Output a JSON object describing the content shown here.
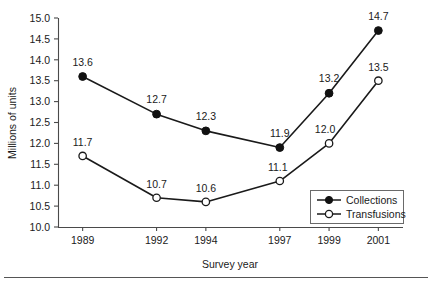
{
  "chart_data": {
    "type": "line",
    "title": "",
    "xlabel": "Survey year",
    "ylabel": "Millions of units",
    "categories": [
      "1989",
      "1992",
      "1994",
      "1997",
      "1999",
      "2001"
    ],
    "x": [
      1989,
      1992,
      1994,
      1997,
      1999,
      2001
    ],
    "xlim": [
      1988,
      2002
    ],
    "ylim": [
      10.0,
      15.0
    ],
    "ytick_labels": [
      "10.0",
      "10.5",
      "11.0",
      "11.5",
      "12.0",
      "12.5",
      "13.0",
      "13.5",
      "14.0",
      "14.5",
      "15.0"
    ],
    "ytick_values": [
      10.0,
      10.5,
      11.0,
      11.5,
      12.0,
      12.5,
      13.0,
      13.5,
      14.0,
      14.5,
      15.0
    ],
    "grid": false,
    "legend_position": "lower-right-inside",
    "series": [
      {
        "name": "Collections",
        "marker": "filled-circle",
        "values": [
          13.6,
          12.7,
          12.3,
          11.9,
          13.2,
          14.7
        ],
        "data_labels": [
          "13.6",
          "12.7",
          "12.3",
          "11.9",
          "13.2",
          "14.7"
        ]
      },
      {
        "name": "Transfusions",
        "marker": "open-circle",
        "values": [
          11.7,
          10.7,
          10.6,
          11.1,
          12.0,
          13.5
        ],
        "data_labels": [
          "11.7",
          "10.7",
          "10.6",
          "11.1",
          "12.0",
          "13.5"
        ]
      }
    ],
    "colors": {
      "line": "#1a1a1a",
      "axis": "#4a4a4a",
      "text": "#1a1a1a",
      "marker_fill_open": "#ffffff",
      "marker_fill_filled": "#111111",
      "background": "#ffffff"
    }
  },
  "legend": {
    "entries": [
      {
        "label": "Collections"
      },
      {
        "label": "Transfusions"
      }
    ]
  },
  "axes": {
    "y_title": "Millions of units",
    "x_title": "Survey year"
  }
}
